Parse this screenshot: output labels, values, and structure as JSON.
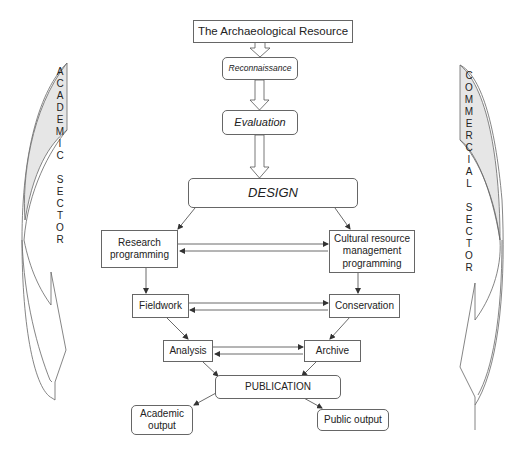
{
  "diagram": {
    "nodes": {
      "resource": "The Archaeological Resource",
      "reconnaissance": "Reconnaissance",
      "evaluation": "Evaluation",
      "design": "DESIGN",
      "research": "Research programming",
      "crm": "Cultural resource management programming",
      "fieldwork": "Fieldwork",
      "conservation": "Conservation",
      "analysis": "Analysis",
      "archive": "Archive",
      "publication": "PUBLICATION",
      "academic_output": "Academic output",
      "public_output": "Public output"
    },
    "sides": {
      "left": "ACADEMIC SECTOR",
      "right": "COMMERCIAL SECTOR"
    },
    "colors": {
      "line": "#555555",
      "fill_shaded": "#e6e6e6",
      "text": "#222222"
    }
  }
}
